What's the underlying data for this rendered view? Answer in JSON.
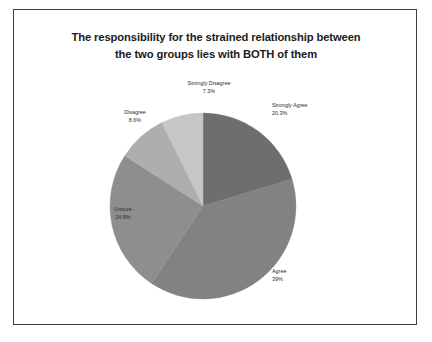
{
  "slide": {
    "title_line_1": "The responsibility for the strained relationship between",
    "title_line_2": "the two groups lies with BOTH of them"
  },
  "chart_data": {
    "type": "pie",
    "title": "The responsibility for the strained relationship between the two groups lies with BOTH of them",
    "categories": [
      "Strongly Agree",
      "Agree",
      "Unsure",
      "Disagree",
      "Strongly Disagree"
    ],
    "values": [
      20.3,
      39,
      24.8,
      8.6,
      7.3
    ],
    "value_labels": [
      "20.3%",
      "39%",
      "24.8%",
      "8.6%",
      "7.3%"
    ],
    "colors": [
      "#6e6e6e",
      "#828282",
      "#8e8e8e",
      "#aeaeae",
      "#c6c6c6"
    ],
    "start_angle_deg": 0,
    "direction": "clockwise",
    "legend": "none",
    "labels_position": "outside",
    "slices": [
      {
        "name": "Strongly Agree",
        "value": 20.3,
        "label": "20.3%",
        "color": "#6e6e6e"
      },
      {
        "name": "Agree",
        "value": 39,
        "label": "39%",
        "color": "#828282"
      },
      {
        "name": "Unsure",
        "value": 24.8,
        "label": "24.8%",
        "color": "#8e8e8e"
      },
      {
        "name": "Disagree",
        "value": 8.6,
        "label": "8.6%",
        "color": "#aeaeae"
      },
      {
        "name": "Strongly Disagree",
        "value": 7.3,
        "label": "7.3%",
        "color": "#c6c6c6"
      }
    ]
  },
  "style": {
    "frame_border_color": "#3f3f3f",
    "background": "#ffffff",
    "text_color": "#2b2b2b"
  }
}
